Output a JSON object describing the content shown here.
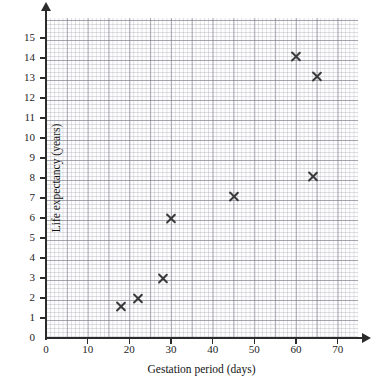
{
  "chart_data": {
    "type": "scatter",
    "title": "",
    "xlabel": "Gestation period (days)",
    "ylabel": "Life expectancy (years)",
    "xlim": [
      0,
      75
    ],
    "ylim": [
      0,
      15.8
    ],
    "grid": "graph-paper, major every 5 days / 1 year, minor every 1 day / 0.2 year",
    "legend": "none",
    "x_ticks": [
      0,
      10,
      20,
      30,
      40,
      50,
      60,
      70
    ],
    "y_ticks": [
      0,
      1,
      2,
      3,
      4,
      5,
      6,
      7,
      8,
      9,
      10,
      11,
      12,
      13,
      14,
      15
    ],
    "marker": "cross",
    "points": [
      {
        "x": 18,
        "y": 1.6
      },
      {
        "x": 22,
        "y": 2.0
      },
      {
        "x": 28,
        "y": 3.0
      },
      {
        "x": 30,
        "y": 6.0
      },
      {
        "x": 45,
        "y": 7.1
      },
      {
        "x": 60,
        "y": 14.1
      },
      {
        "x": 64,
        "y": 8.1
      },
      {
        "x": 65,
        "y": 13.1
      }
    ]
  },
  "colors": {
    "marker": "#3a3a3a",
    "axis": "#2b2b2b",
    "grid_major": "#78788a",
    "grid_minor": "#9696a5",
    "background": "#ffffff"
  }
}
